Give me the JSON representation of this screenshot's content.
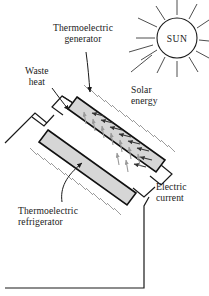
{
  "figure": {
    "type": "diagram",
    "background_color": "#ffffff",
    "line_color": "#1a1a1a",
    "slab_fill_color": "#d4d4d4",
    "hatch_color": "#8a8a8a",
    "arrow_dark_color": "#333333",
    "arrow_gray_color": "#9a9a9a"
  },
  "sun": {
    "label": "SUN",
    "center_x": 177,
    "center_y": 38,
    "radius": 20,
    "ray_count": 12
  },
  "labels": {
    "generator": {
      "line1": "Thermoelectric",
      "line2": "generator",
      "x": 53,
      "y": 27
    },
    "waste_heat": {
      "line1": "Waste",
      "line2": "heat",
      "x": 26,
      "y": 68
    },
    "solar_energy": {
      "line1": "Solar",
      "line2": "energy",
      "x": 130,
      "y": 86
    },
    "electric_current": {
      "line1": "Electric",
      "line2": "current",
      "x": 155,
      "y": 183
    },
    "refrigerator": {
      "line1": "Thermoelectric",
      "line2": "refrigerator",
      "x": 18,
      "y": 207
    }
  },
  "components": {
    "upper_slab_name": "thermoelectric-generator-slab",
    "lower_slab_name": "thermoelectric-refrigerator-slab",
    "wire_name": "electric-current-wire",
    "heat_flow_name": "heat-flow-arrows"
  }
}
